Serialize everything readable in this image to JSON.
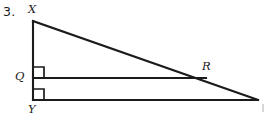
{
  "figure": {
    "item_number": "3.",
    "type": "geometry-diagram",
    "stroke_color": "#1b1b1b",
    "background_color": "#ffffff",
    "labels": {
      "x": "X",
      "q": "Q",
      "y": "Y",
      "r": "R"
    },
    "points": {
      "X": {
        "x": 33,
        "y": 21
      },
      "Q": {
        "x": 33,
        "y": 78
      },
      "Y": {
        "x": 33,
        "y": 100
      },
      "R": {
        "x": 205,
        "y": 78
      },
      "Z": {
        "x": 258,
        "y": 100
      }
    },
    "segments": [
      {
        "name": "XY",
        "from": "X",
        "to": "Y"
      },
      {
        "name": "XZ",
        "from": "X",
        "to": "Z"
      },
      {
        "name": "YZ",
        "from": "Y",
        "to": "Z"
      },
      {
        "name": "QR",
        "from": "Q",
        "to": "R"
      }
    ],
    "right_angles": [
      {
        "name": "angle-XQR",
        "vertex": "Q",
        "size": 11
      },
      {
        "name": "angle-XYZ",
        "vertex": "Y",
        "size": 11
      }
    ]
  }
}
